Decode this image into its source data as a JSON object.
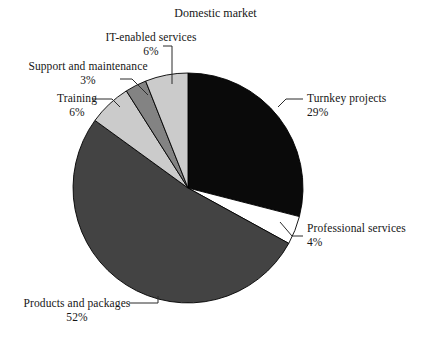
{
  "chart_data": {
    "type": "pie",
    "title": "Domestic market",
    "subtitle": "",
    "xlabel": "",
    "ylabel": "",
    "units": "percent",
    "legend_position": "none",
    "grid": false,
    "labels_show_percent": true,
    "start_angle_deg": 0,
    "direction": "clockwise",
    "categories": [
      "Turnkey projects",
      "Professional services",
      "Products and packages",
      "Training",
      "Support and maintenance",
      "IT-enabled services"
    ],
    "values": [
      29,
      4,
      52,
      6,
      3,
      6
    ],
    "slices": [
      {
        "label": "Turnkey projects",
        "value": 29,
        "percent_text": "29%",
        "color": "#0a0a0a",
        "stroke": "#000000"
      },
      {
        "label": "Professional services",
        "value": 4,
        "percent_text": "4%",
        "color": "#ffffff",
        "stroke": "#000000"
      },
      {
        "label": "Products and packages",
        "value": 52,
        "percent_text": "52%",
        "color": "#434343",
        "stroke": "#000000"
      },
      {
        "label": "Training",
        "value": 6,
        "percent_text": "6%",
        "color": "#cbcbcb",
        "stroke": "#000000"
      },
      {
        "label": "Support and maintenance",
        "value": 3,
        "percent_text": "3%",
        "color": "#838383",
        "stroke": "#000000"
      },
      {
        "label": "IT-enabled services",
        "value": 6,
        "percent_text": "6%",
        "color": "#cbcbcb",
        "stroke": "#000000"
      }
    ]
  },
  "title": {
    "text": "Domestic market"
  },
  "labels": {
    "it_enabled": {
      "name": "IT-enabled services",
      "pct": "6%"
    },
    "support": {
      "name": "Support and maintenance",
      "pct": "3%"
    },
    "training": {
      "name": "Training",
      "pct": "6%"
    },
    "turnkey": {
      "name": "Turnkey projects",
      "pct": "29%"
    },
    "professional": {
      "name": "Professional services",
      "pct": "4%"
    },
    "products": {
      "name": "Products and packages",
      "pct": "52%"
    }
  },
  "palette": {
    "background": "#ffffff",
    "text": "#161616",
    "outline": "#000000",
    "black_slice": "#0a0a0a",
    "dark_gray_slice": "#434343",
    "mid_gray_slice": "#838383",
    "light_gray_slice": "#cbcbcb",
    "white_slice": "#ffffff",
    "leader_line": "#2b2b2b"
  },
  "geometry": {
    "center_x": 188,
    "center_y": 188,
    "radius": 115
  }
}
